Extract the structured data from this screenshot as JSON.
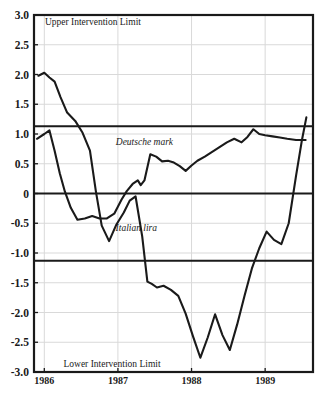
{
  "chart_data": {
    "type": "line",
    "title": "",
    "subtitle": "",
    "xlabel": "",
    "ylabel": "",
    "xlim": [
      1985.86,
      1989.65
    ],
    "ylim": [
      -3.0,
      3.0
    ],
    "grid": true,
    "legend_position": "inline-annotations",
    "y_ticks": [
      "3.0",
      "2.5",
      "2.0",
      "1.5",
      "1.0",
      "0.5",
      "0",
      "-0.5",
      "-1.0",
      "-1.5",
      "-2.0",
      "-2.5",
      "-3.0"
    ],
    "y_tick_values": [
      3.0,
      2.5,
      2.0,
      1.5,
      1.0,
      0.5,
      0,
      -0.5,
      -1.0,
      -1.5,
      -2.0,
      -2.5,
      -3.0
    ],
    "x_ticks": [
      "1986",
      "1987",
      "1988",
      "1989"
    ],
    "x_tick_values": [
      1986,
      1987,
      1988,
      1989
    ],
    "reference_lines": [
      {
        "name": "upper-intervention-limit",
        "label": "Upper Intervention Limit",
        "value": 1.13
      },
      {
        "name": "zero-line",
        "label": "",
        "value": 0
      },
      {
        "name": "lower-intervention-limit",
        "label": "Lower Intervention Limit",
        "value": -1.13
      }
    ],
    "annotations": [
      {
        "name": "upper-intervention-limit-label",
        "text": "Upper Intervention Limit",
        "x": 1986.66,
        "y": 2.84
      },
      {
        "name": "deutsche-mark-label",
        "text": "Deutsche mark",
        "x": 1987.36,
        "y": 0.82
      },
      {
        "name": "italian-lira-label",
        "text": "Italian lira",
        "x": 1987.25,
        "y": -0.63
      },
      {
        "name": "lower-intervention-limit-label",
        "text": "Lower Intervention Limit",
        "x": 1986.92,
        "y": -2.92
      }
    ],
    "series": [
      {
        "name": "Deutsche mark",
        "color": "#1a1a1a",
        "x": [
          1985.9,
          1986.0,
          1986.07,
          1986.14,
          1986.21,
          1986.28,
          1986.36,
          1986.45,
          1986.55,
          1986.65,
          1986.75,
          1986.85,
          1986.95,
          1987.05,
          1987.12,
          1987.2,
          1987.27,
          1987.31,
          1987.36,
          1987.44,
          1987.52,
          1987.6,
          1987.68,
          1987.76,
          1987.84,
          1987.92,
          1988.0,
          1988.08,
          1988.18,
          1988.28,
          1988.38,
          1988.48,
          1988.58,
          1988.68,
          1988.76,
          1988.84,
          1988.92,
          1989.0,
          1989.1,
          1989.2,
          1989.3,
          1989.42,
          1989.55
        ],
        "y": [
          0.92,
          1.0,
          1.06,
          0.72,
          0.34,
          0.03,
          -0.24,
          -0.44,
          -0.42,
          -0.38,
          -0.42,
          -0.42,
          -0.34,
          -0.1,
          0.04,
          0.16,
          0.22,
          0.14,
          0.22,
          0.66,
          0.62,
          0.54,
          0.55,
          0.52,
          0.46,
          0.38,
          0.47,
          0.55,
          0.62,
          0.7,
          0.78,
          0.86,
          0.92,
          0.86,
          0.95,
          1.08,
          1.0,
          0.98,
          0.96,
          0.94,
          0.92,
          0.9,
          0.9
        ]
      },
      {
        "name": "Italian lira",
        "color": "#1a1a1a",
        "x": [
          1985.92,
          1986.0,
          1986.07,
          1986.14,
          1986.22,
          1986.31,
          1986.42,
          1986.52,
          1986.62,
          1986.7,
          1986.78,
          1986.88,
          1986.98,
          1987.08,
          1987.16,
          1987.24,
          1987.33,
          1987.4,
          1987.46,
          1987.53,
          1987.62,
          1987.72,
          1987.82,
          1987.92,
          1988.02,
          1988.12,
          1988.22,
          1988.32,
          1988.42,
          1988.52,
          1988.62,
          1988.72,
          1988.82,
          1988.92,
          1989.02,
          1989.12,
          1989.22,
          1989.32,
          1989.42,
          1989.5,
          1989.56
        ],
        "y": [
          1.98,
          2.03,
          1.95,
          1.88,
          1.62,
          1.36,
          1.22,
          1.02,
          0.72,
          0.04,
          -0.54,
          -0.8,
          -0.52,
          -0.32,
          -0.12,
          -0.05,
          -0.72,
          -1.48,
          -1.52,
          -1.58,
          -1.55,
          -1.62,
          -1.72,
          -2.02,
          -2.4,
          -2.76,
          -2.42,
          -2.03,
          -2.38,
          -2.63,
          -2.2,
          -1.72,
          -1.26,
          -0.92,
          -0.64,
          -0.78,
          -0.85,
          -0.5,
          0.3,
          0.9,
          1.28
        ]
      }
    ]
  }
}
